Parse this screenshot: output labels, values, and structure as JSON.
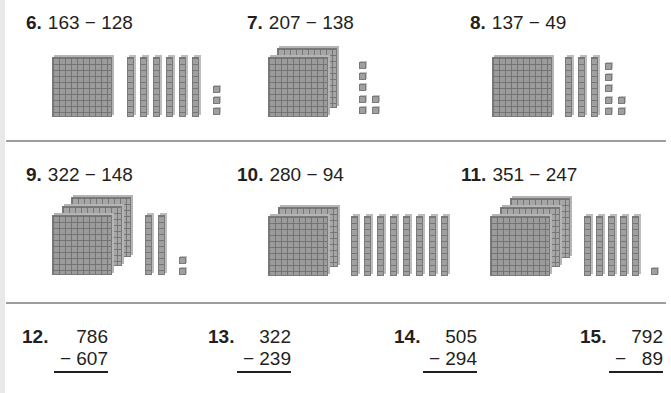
{
  "rows": [
    {
      "problems": [
        {
          "number": "6.",
          "expression": "163 − 128",
          "blocks": {
            "hundreds": 1,
            "tens": 6,
            "ones": 3
          }
        },
        {
          "number": "7.",
          "expression": "207 − 138",
          "blocks": {
            "hundreds": 2,
            "tens": 0,
            "ones": 7
          }
        },
        {
          "number": "8.",
          "expression": "137 − 49",
          "blocks": {
            "hundreds": 1,
            "tens": 3,
            "ones": 7
          }
        }
      ]
    },
    {
      "problems": [
        {
          "number": "9.",
          "expression": "322 − 148",
          "blocks": {
            "hundreds": 3,
            "tens": 2,
            "ones": 2
          }
        },
        {
          "number": "10.",
          "expression": "280 − 94",
          "blocks": {
            "hundreds": 2,
            "tens": 8,
            "ones": 0
          }
        },
        {
          "number": "11.",
          "expression": "351 − 247",
          "blocks": {
            "hundreds": 3,
            "tens": 5,
            "ones": 1
          }
        }
      ]
    }
  ],
  "vertical_problems": [
    {
      "number": "12.",
      "top": "786",
      "bottom": "− 607"
    },
    {
      "number": "13.",
      "top": "322",
      "bottom": "− 239"
    },
    {
      "number": "14.",
      "top": "505",
      "bottom": "− 294"
    },
    {
      "number": "15.",
      "top": "792",
      "bottom": "−   89"
    }
  ],
  "colors": {
    "block_fill": "#9c9c9c",
    "block_line": "#7a7a7a",
    "rule": "#9e9e9e",
    "text": "#231f20"
  }
}
